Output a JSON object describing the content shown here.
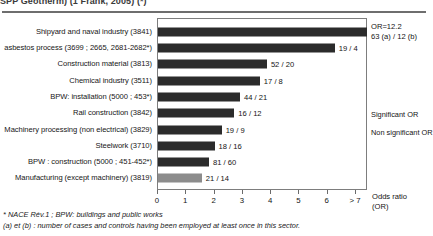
{
  "clipped_caption": "SPP Geotherm) (1 Frank, 2005) (*)",
  "chart_data": {
    "type": "bar",
    "title": "",
    "xlabel": "Odds ratio (OR)",
    "ylabel": "",
    "xlim": [
      0,
      7
    ],
    "grid": false,
    "orientation": "horizontal",
    "xtick_labels": [
      "0",
      "1",
      "2",
      "3",
      "4",
      "5",
      "6",
      "> 7"
    ],
    "categories": [
      "Shipyard and naval industry (3841)",
      "asbestos process (3699 ; 2665, 2681-2682*)",
      "Construction material (3813)",
      "Chemical industry (3511)",
      "BPW: installation (5000 ; 453*)",
      "Rail construction (3842)",
      "Machinery processing (non electrical) (3829)",
      "Steelwork (3710)",
      "BPW : construction  (5000 ; 451-452*)",
      "Manufacturing (except machinery) (3819)"
    ],
    "values": [
      7.4,
      6.25,
      3.85,
      3.6,
      2.9,
      2.7,
      2.25,
      2.0,
      1.8,
      1.55
    ],
    "significance": [
      "significant",
      "significant",
      "significant",
      "significant",
      "significant",
      "significant",
      "significant",
      "significant",
      "significant",
      "non-significant"
    ],
    "data_labels": [
      "",
      "19 / 4",
      "52 / 20",
      "17 / 8",
      "44 / 21",
      "16 / 12",
      "19 / 9",
      "18 / 16",
      "81 / 60",
      "21 / 14"
    ],
    "annotations": [
      {
        "line1": "OR=12.2",
        "line2": "63 (a) / 12 (b)"
      }
    ],
    "legend": {
      "position": "right",
      "entries": [
        "Significant OR",
        "Non significant OR"
      ]
    },
    "colors": {
      "significant": "#2b2b2b",
      "non_significant": "#8c8c8c",
      "frame": "#7d7d7d"
    }
  },
  "footnotes": {
    "line1": "* NACE Rév.1 ; BPW: buildings and public works",
    "line2": "(a) et (b) : number of cases and controls having been employed at least once in this sector."
  }
}
